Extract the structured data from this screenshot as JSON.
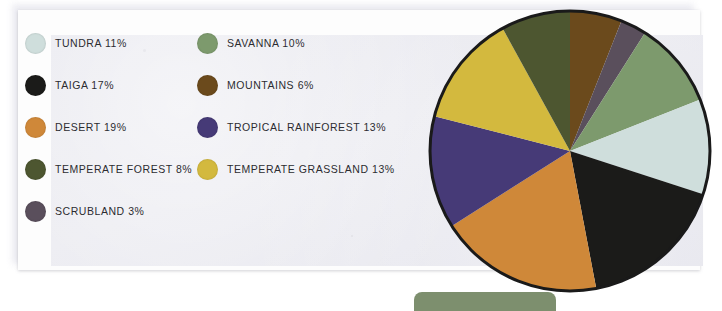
{
  "chart_data": {
    "type": "pie",
    "title": "",
    "unit": "percent",
    "legend_position": "left",
    "categories": [
      "Tundra",
      "Savanna",
      "Taiga",
      "Mountains",
      "Desert",
      "Tropical Rainforest",
      "Temperate Forest",
      "Temperate Grassland",
      "Scrubland"
    ],
    "values": [
      11,
      10,
      17,
      6,
      19,
      13,
      8,
      13,
      3
    ],
    "slice_order_clockwise_from_top": [
      "Mountains",
      "Scrubland",
      "Savanna",
      "Tundra",
      "Taiga",
      "Desert",
      "Tropical Rainforest",
      "Temperate Grassland",
      "Temperate Forest"
    ],
    "colors": {
      "Tundra": "#cfdedc",
      "Savanna": "#7d9a6d",
      "Taiga": "#1b1b19",
      "Mountains": "#6b4a1c",
      "Desert": "#cf8839",
      "Tropical Rainforest": "#463a77",
      "Temperate Forest": "#4d5630",
      "Temperate Grassland": "#d3b93e",
      "Scrubland": "#5a4f5c"
    }
  },
  "legend": {
    "items": [
      {
        "name": "Tundra",
        "label": "TUNDRA 11%",
        "value": 11,
        "color": "#cfdedc",
        "swatch": "tundra-swatch"
      },
      {
        "name": "Savanna",
        "label": "SAVANNA 10%",
        "value": 10,
        "color": "#7d9a6d",
        "swatch": "savanna-swatch"
      },
      {
        "name": "Taiga",
        "label": "TAIGA 17%",
        "value": 17,
        "color": "#1b1b19",
        "swatch": "taiga-swatch"
      },
      {
        "name": "Mountains",
        "label": "MOUNTAINS 6%",
        "value": 6,
        "color": "#6b4a1c",
        "swatch": "mountains-swatch"
      },
      {
        "name": "Desert",
        "label": "DESERT 19%",
        "value": 19,
        "color": "#cf8839",
        "swatch": "desert-swatch"
      },
      {
        "name": "Tropical Rainforest",
        "label": "TROPICAL RAINFOREST 13%",
        "value": 13,
        "color": "#463a77",
        "swatch": "tropical-rainforest-swatch"
      },
      {
        "name": "Temperate Forest",
        "label": "TEMPERATE FOREST 8%",
        "value": 8,
        "color": "#4d5630",
        "swatch": "temperate-forest-swatch"
      },
      {
        "name": "Temperate Grassland",
        "label": "TEMPERATE GRASSLAND 13%",
        "value": 13,
        "color": "#d3b93e",
        "swatch": "temperate-grassland-swatch"
      },
      {
        "name": "Scrubland",
        "label": "SCRUBLAND 3%",
        "value": 3,
        "color": "#5a4f5c",
        "swatch": "scrubland-swatch"
      }
    ]
  },
  "pie": {
    "center_x": 143,
    "center_y": 143,
    "radius": 140,
    "stroke": "#1a1a1a",
    "stroke_width": 3
  },
  "bottom_bar": {
    "color": "#7d8f6e",
    "label": ""
  },
  "panel": {
    "frame_color": "#fdfdfd",
    "panel_color": "#e8e8ee"
  }
}
